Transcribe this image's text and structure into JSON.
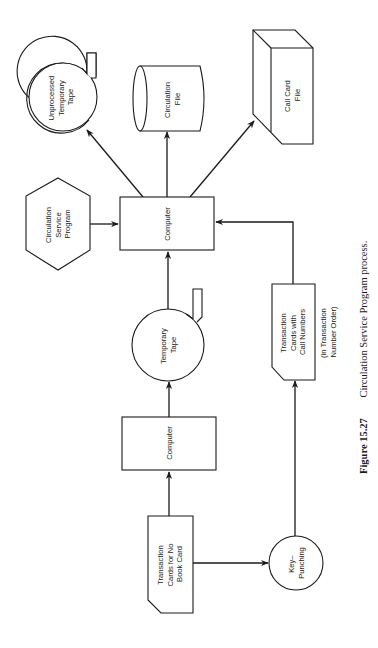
{
  "figure": {
    "caption_number": "Figure 15.27",
    "caption_text": "Circulation Service Program process.",
    "orientation": "rotated 90deg counter-clockwise"
  },
  "nodes": {
    "unprocessed_tape": {
      "type": "magnetic-tape",
      "lines": [
        "Unprocessed",
        "Temporary",
        "Tape"
      ]
    },
    "circulation_file": {
      "type": "disk-storage",
      "lines": [
        "Circulation",
        "File"
      ]
    },
    "call_card_file": {
      "type": "offline-storage-box",
      "lines": [
        "Call Card",
        "File"
      ]
    },
    "circulation_program": {
      "type": "preparation-hexagon",
      "lines": [
        "Circulation",
        "Service",
        "Program"
      ]
    },
    "computer_main": {
      "type": "process",
      "lines": [
        "Computer"
      ]
    },
    "temporary_tape": {
      "type": "magnetic-tape",
      "lines": [
        "Temporary",
        "Tape"
      ]
    },
    "cards_call_numbers": {
      "type": "punched-card",
      "lines": [
        "Transaction",
        "Cards with",
        "Call Numbers"
      ],
      "note_lines": [
        "(in Transaction",
        "Number Order)"
      ]
    },
    "computer_first": {
      "type": "process",
      "lines": [
        "Computer"
      ]
    },
    "cards_no_book": {
      "type": "punched-card",
      "lines": [
        "Transaction",
        "Cards for No",
        "Book Card"
      ]
    },
    "key_punching": {
      "type": "manual-operation-circle",
      "lines": [
        "Key–",
        "Punching"
      ]
    }
  },
  "edges": [
    {
      "from": "cards_no_book",
      "to": "computer_first"
    },
    {
      "from": "cards_no_book",
      "to": "key_punching"
    },
    {
      "from": "computer_first",
      "to": "temporary_tape"
    },
    {
      "from": "temporary_tape",
      "to": "computer_main"
    },
    {
      "from": "key_punching",
      "to": "cards_call_numbers"
    },
    {
      "from": "cards_call_numbers",
      "to": "computer_main"
    },
    {
      "from": "circulation_program",
      "to": "computer_main"
    },
    {
      "from": "computer_main",
      "to": "unprocessed_tape"
    },
    {
      "from": "computer_main",
      "to": "circulation_file"
    },
    {
      "from": "computer_main",
      "to": "call_card_file"
    }
  ],
  "colors": {
    "ink": "#1a1a1a",
    "paper": "#ffffff"
  }
}
